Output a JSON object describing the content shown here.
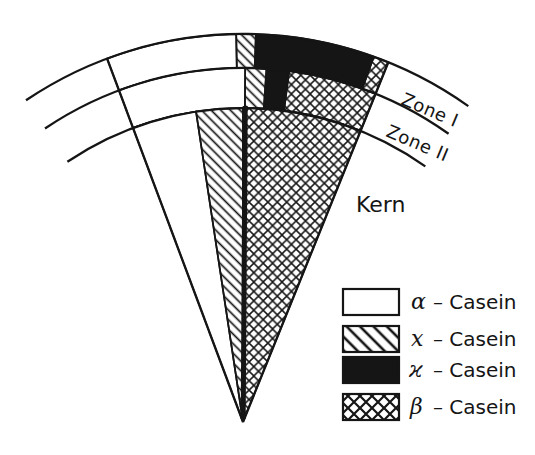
{
  "figure": {
    "type": "casein-micelle-wedge-model",
    "colors": {
      "ink": "#151515",
      "paper": "#ffffff"
    },
    "labels": {
      "zone1": "Zone I",
      "zone2": "Zone II",
      "core": "Kern"
    },
    "legend": {
      "items": [
        {
          "symbol": "α",
          "label": "– Casein",
          "pattern": "plain-white"
        },
        {
          "symbol": "x",
          "label": "– Casein",
          "pattern": "diagonal-hatch"
        },
        {
          "symbol": "ϰ",
          "label": "– Casein",
          "pattern": "solid-black"
        },
        {
          "symbol": "β",
          "label": "– Casein",
          "pattern": "crosshatch"
        }
      ]
    },
    "zone_composition": {
      "zone1": [
        "α-Casein",
        "x-Casein",
        "ϰ-Casein",
        "β-Casein"
      ],
      "zone2": [
        "α-Casein",
        "x-Casein",
        "ϰ-Casein",
        "β-Casein"
      ],
      "kern": [
        "α-Casein",
        "x-Casein",
        "β-Casein"
      ]
    }
  }
}
